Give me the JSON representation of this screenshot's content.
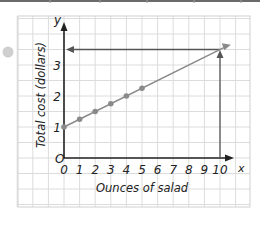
{
  "chart_data": {
    "type": "line",
    "title": "",
    "xlabel": "Ounces of salad",
    "ylabel": "Total cost (dollars)",
    "x_axis_letter": "x",
    "y_axis_letter": "y",
    "origin_label": "O",
    "x_ticks": [
      "0",
      "1",
      "2",
      "3",
      "4",
      "5",
      "6",
      "7",
      "8",
      "9",
      "10"
    ],
    "y_ticks": [
      "1",
      "2",
      "3"
    ],
    "xlim": [
      0,
      10
    ],
    "ylim": [
      0,
      3.5
    ],
    "grid": true,
    "series": [
      {
        "name": "Total cost",
        "points": [
          [
            0,
            1
          ],
          [
            1,
            1.25
          ],
          [
            2,
            1.5
          ],
          [
            3,
            1.75
          ],
          [
            4,
            2
          ],
          [
            5,
            2.25
          ]
        ],
        "line_extends_to": [
          10.5,
          3.625
        ]
      }
    ],
    "annotations": [
      {
        "type": "arrow-up",
        "from": [
          10,
          0
        ],
        "to": [
          10,
          3.5
        ]
      },
      {
        "type": "arrow-left",
        "from": [
          10,
          3.5
        ],
        "to": [
          0,
          3.5
        ]
      }
    ],
    "colors": {
      "line": "#8a8a8a",
      "axes": "#222222",
      "grid": "#d9d9d9",
      "marker": "#8a8a8a",
      "bullet": "#cfcfcf"
    }
  }
}
